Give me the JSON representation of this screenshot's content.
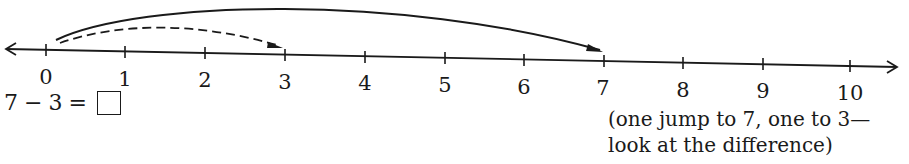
{
  "number_line": {
    "ticks": [
      "0",
      "1",
      "2",
      "3",
      "4",
      "5",
      "6",
      "7",
      "8",
      "9",
      "10"
    ],
    "start": 0,
    "end": 10
  },
  "jumps": [
    {
      "from": 0,
      "to": 7,
      "style": "solid"
    },
    {
      "from": 0,
      "to": 3,
      "style": "dashed"
    }
  ],
  "equation": {
    "left": "7",
    "operator": "−",
    "right": "3",
    "equals": "=",
    "answer": ""
  },
  "note": {
    "line1": "(one jump to 7, one to 3—",
    "line2": "look at the difference)"
  }
}
